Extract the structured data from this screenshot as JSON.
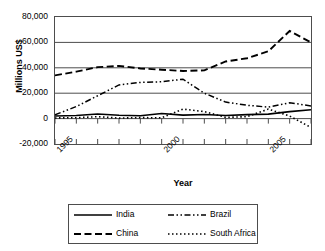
{
  "chart_data": {
    "type": "line",
    "title": "",
    "xlabel": "Year",
    "ylabel": "Millions US$",
    "x": [
      1995,
      1996,
      1997,
      1998,
      1999,
      2000,
      2001,
      2002,
      2003,
      2004,
      2005,
      2006,
      2007
    ],
    "xlim": [
      1995,
      2007
    ],
    "ylim": [
      -20000,
      80000
    ],
    "ytick_labels": [
      "80,000",
      "60,000",
      "40,000",
      "20,000",
      "0",
      "-20,000"
    ],
    "ytick_values": [
      80000,
      60000,
      40000,
      20000,
      0,
      -20000
    ],
    "xtick_labels": [
      "1995",
      "2000",
      "2005"
    ],
    "xtick_values": [
      1995,
      2000,
      2005
    ],
    "grid": true,
    "legend_position": "bottom",
    "series": [
      {
        "name": "India",
        "style": "solid",
        "color": "#000000",
        "values": [
          2100,
          2400,
          3600,
          2600,
          2200,
          4000,
          2700,
          3200,
          2400,
          3100,
          3500,
          5500,
          7000
        ]
      },
      {
        "name": "China",
        "style": "dashed",
        "color": "#000000",
        "values": [
          34000,
          37000,
          40500,
          41500,
          39500,
          38500,
          37500,
          38000,
          45000,
          47500,
          53000,
          69000,
          60000
        ]
      },
      {
        "name": "Brazil",
        "style": "dash-dot",
        "color": "#000000",
        "values": [
          3000,
          9500,
          18000,
          26500,
          28500,
          29000,
          31000,
          20000,
          13000,
          10500,
          9000,
          12500,
          10000
        ]
      },
      {
        "name": "South Africa",
        "style": "dotted",
        "color": "#000000",
        "values": [
          500,
          700,
          1500,
          400,
          800,
          600,
          7500,
          5500,
          1000,
          1500,
          7500,
          2000,
          -7000
        ]
      }
    ]
  },
  "legend": {
    "entries": [
      {
        "label": "India"
      },
      {
        "label": "Brazil"
      },
      {
        "label": "China"
      },
      {
        "label": "South Africa"
      }
    ]
  }
}
